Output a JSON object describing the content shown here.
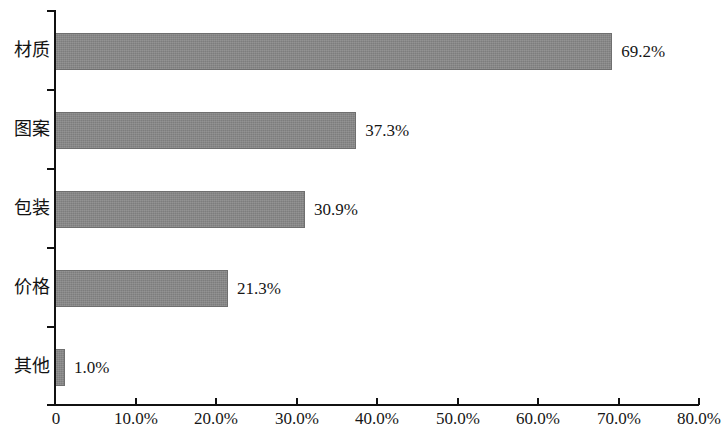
{
  "chart_data": {
    "type": "bar",
    "orientation": "horizontal",
    "title": "",
    "subtitle": "",
    "xlabel": "",
    "ylabel": "",
    "categories": [
      "材质",
      "图案",
      "包装",
      "价格",
      "其他"
    ],
    "values": [
      69.2,
      37.3,
      30.9,
      21.3,
      1.0
    ],
    "value_labels": [
      "69.2%",
      "37.3%",
      "30.9%",
      "21.3%",
      "1.0%"
    ],
    "xlim": [
      0,
      80
    ],
    "xtick_values": [
      0,
      10,
      20,
      30,
      40,
      50,
      60,
      70,
      80
    ],
    "xtick_labels": [
      "0",
      "10.0%",
      "20.0%",
      "30.0%",
      "40.0%",
      "50.0%",
      "60.0%",
      "70.0%",
      "80.0%"
    ],
    "grid": false,
    "legend": null,
    "legend_position": "none",
    "series": [
      {
        "name": "",
        "values": [
          69.2,
          37.3,
          30.9,
          21.3,
          1.0
        ]
      }
    ],
    "colors": {
      "bar_fill": "#7d7d7d",
      "bar_edge": "#6f6f6f",
      "axis": "#111111",
      "text": "#161616",
      "background": "#ffffff"
    }
  }
}
